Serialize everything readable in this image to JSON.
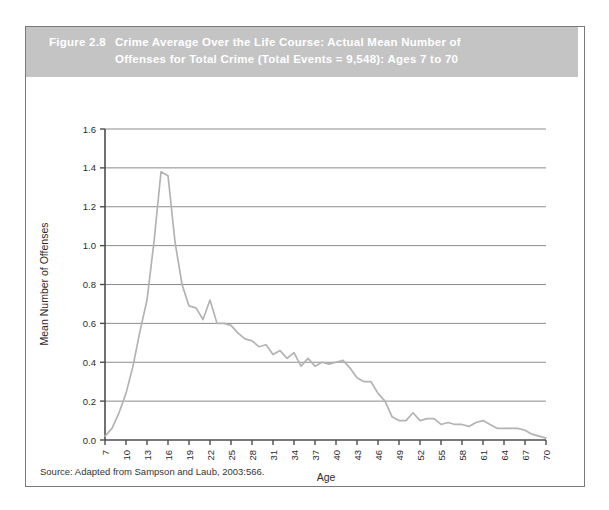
{
  "figure": {
    "number": "Figure 2.8",
    "caption_line1": "Crime Average Over the Life Course: Actual Mean Number of",
    "caption_line2": "Offenses for Total Crime (Total Events = 9,548): Ages 7 to 70",
    "source": "Source: Adapted from Sampson and Laub, 2003:566."
  },
  "colors": {
    "band_background": "#c4c4c4",
    "band_text": "#ffffff",
    "frame_border": "#7a7a7a",
    "axis": "#4d4d4d",
    "gridline": "#8c8c8c",
    "series_line": "#b3b3b3",
    "page_background": "#ffffff",
    "text": "#2b2b2b"
  },
  "chart_data": {
    "type": "line",
    "title": "Crime Average Over the Life Course: Actual Mean Number of Offenses for Total Crime (Total Events = 9,548): Ages 7 to 70",
    "xlabel": "Age",
    "ylabel": "Mean Number of Offenses",
    "xlim": [
      7,
      70
    ],
    "ylim": [
      0.0,
      1.6
    ],
    "grid": true,
    "legend": null,
    "y_ticks": [
      "0.0",
      "0.2",
      "0.4",
      "0.6",
      "0.8",
      "1.0",
      "1.2",
      "1.4",
      "1.6"
    ],
    "y_tick_values": [
      0.0,
      0.2,
      0.4,
      0.6,
      0.8,
      1.0,
      1.2,
      1.4,
      1.6
    ],
    "x_ticks": [
      "7",
      "10",
      "13",
      "16",
      "19",
      "22",
      "25",
      "28",
      "31",
      "34",
      "37",
      "40",
      "43",
      "46",
      "49",
      "52",
      "55",
      "58",
      "61",
      "64",
      "67",
      "70"
    ],
    "x_tick_values": [
      7,
      10,
      13,
      16,
      19,
      22,
      25,
      28,
      31,
      34,
      37,
      40,
      43,
      46,
      49,
      52,
      55,
      58,
      61,
      64,
      67,
      70
    ],
    "x": [
      7,
      8,
      9,
      10,
      11,
      12,
      13,
      14,
      15,
      16,
      17,
      18,
      19,
      20,
      21,
      22,
      23,
      24,
      25,
      26,
      27,
      28,
      29,
      30,
      31,
      32,
      33,
      34,
      35,
      36,
      37,
      38,
      39,
      40,
      41,
      42,
      43,
      44,
      45,
      46,
      47,
      48,
      49,
      50,
      51,
      52,
      53,
      54,
      55,
      56,
      57,
      58,
      59,
      60,
      61,
      62,
      63,
      64,
      65,
      66,
      67,
      68,
      69,
      70
    ],
    "series": [
      {
        "name": "Total crime mean offenses",
        "values": [
          0.02,
          0.06,
          0.14,
          0.24,
          0.38,
          0.56,
          0.72,
          1.02,
          1.38,
          1.36,
          1.02,
          0.8,
          0.69,
          0.68,
          0.62,
          0.72,
          0.6,
          0.6,
          0.59,
          0.55,
          0.52,
          0.51,
          0.48,
          0.49,
          0.44,
          0.46,
          0.42,
          0.45,
          0.38,
          0.42,
          0.38,
          0.4,
          0.39,
          0.4,
          0.41,
          0.37,
          0.32,
          0.3,
          0.3,
          0.24,
          0.2,
          0.12,
          0.1,
          0.1,
          0.14,
          0.1,
          0.11,
          0.11,
          0.08,
          0.09,
          0.08,
          0.08,
          0.07,
          0.09,
          0.1,
          0.08,
          0.06,
          0.06,
          0.06,
          0.06,
          0.05,
          0.03,
          0.02,
          0.01
        ]
      }
    ],
    "peak": {
      "age": 15,
      "value": 1.38
    }
  }
}
